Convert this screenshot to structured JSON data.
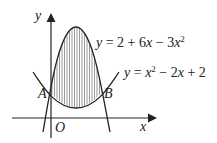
{
  "diagram": {
    "curves": [
      {
        "id": "upper",
        "equation": "y = 2 + 6x − 3x²",
        "label_prefix": "y = 2 + 6",
        "label_x": "x",
        "label_mid": " − 3",
        "label_x2": "x",
        "label_exp": "2"
      },
      {
        "id": "lower",
        "equation": "y = x² − 2x + 2",
        "label_prefix": "y = ",
        "label_x": "x",
        "label_exp": "2",
        "label_rest": " − 2",
        "label_x3": "x",
        "label_end": " + 2"
      }
    ],
    "points": {
      "A": "A",
      "B": "B",
      "O": "O"
    },
    "axes": {
      "x_label": "x",
      "y_label": "y"
    },
    "shaded_region": "between curves from A to B (vertical hatching)"
  }
}
